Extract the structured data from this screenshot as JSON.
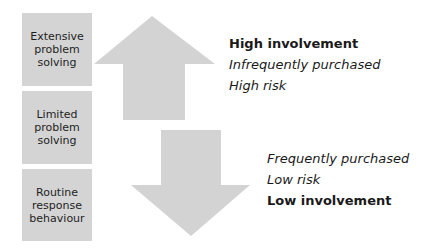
{
  "stages": [
    {
      "label": "Extensive\nproblem\nsolving"
    },
    {
      "label": "Limited\nproblem\nsolving"
    },
    {
      "label": "Routine\nresponse\nbehaviour"
    }
  ],
  "arrows": {
    "up": {
      "direction": "up",
      "color": "#d3d3d3"
    },
    "down": {
      "direction": "down",
      "color": "#d3d3d3"
    }
  },
  "top_labels": {
    "involvement": "High involvement",
    "frequency": "Infrequently purchased",
    "risk": "High risk"
  },
  "bottom_labels": {
    "frequency": "Frequently purchased",
    "risk": "Low risk",
    "involvement": "Low involvement"
  }
}
